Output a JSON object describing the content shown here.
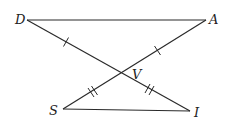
{
  "diagram": {
    "type": "geometry-figure",
    "points": [
      {
        "id": "D",
        "label": "D"
      },
      {
        "id": "A",
        "label": "A"
      },
      {
        "id": "V",
        "label": "V"
      },
      {
        "id": "S",
        "label": "S"
      },
      {
        "id": "I",
        "label": "I"
      }
    ],
    "segments": [
      {
        "from": "D",
        "to": "A"
      },
      {
        "from": "D",
        "to": "I"
      },
      {
        "from": "A",
        "to": "S"
      },
      {
        "from": "S",
        "to": "I"
      }
    ],
    "congruence_marks": [
      {
        "segment": "DV",
        "ticks": 1
      },
      {
        "segment": "AV",
        "ticks": 1
      },
      {
        "segment": "SV",
        "ticks": 2
      },
      {
        "segment": "VI",
        "ticks": 2
      }
    ],
    "colors": {
      "stroke": "#2a2a2a",
      "label": "#222222",
      "background": "#ffffff"
    }
  }
}
